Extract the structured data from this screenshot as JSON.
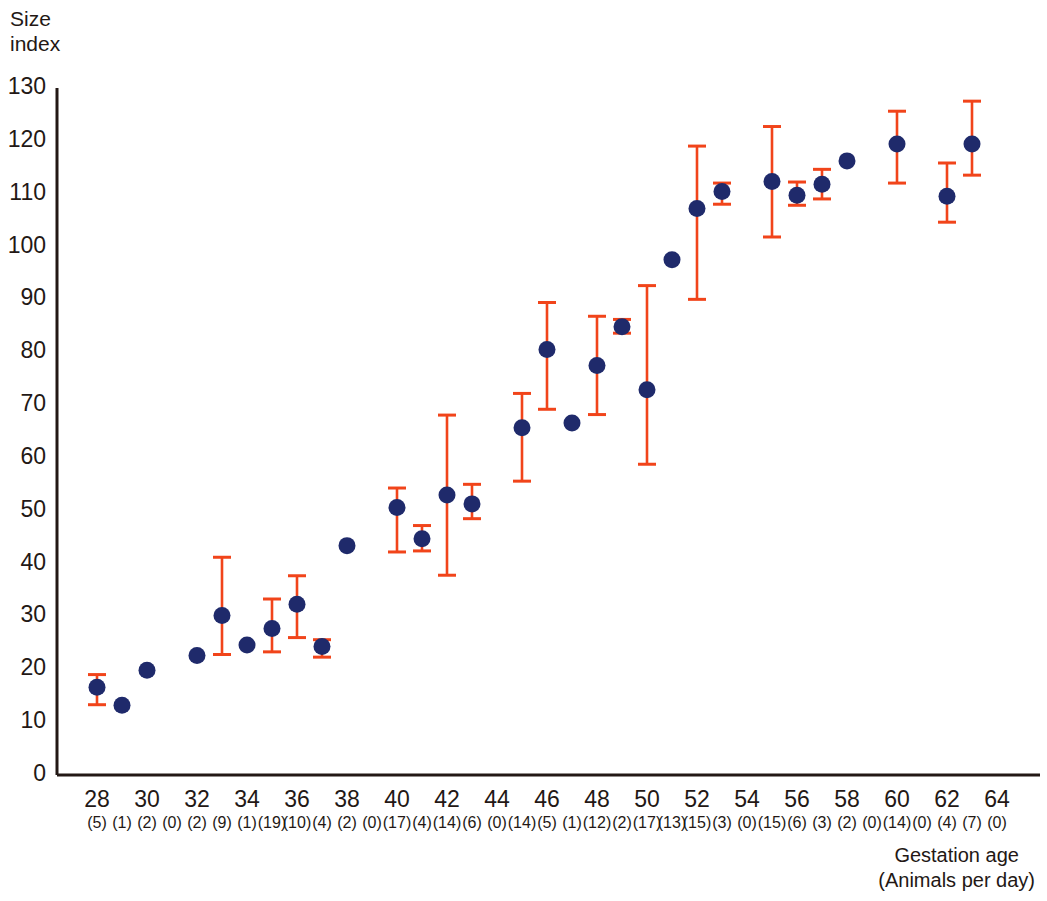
{
  "chart_data": {
    "type": "scatter",
    "title": "",
    "ylabel": "Size index",
    "xlabel": "Gestation age",
    "xlabel_sub": "(Animals per day)",
    "ylim": [
      0,
      130
    ],
    "ytick_values": [
      0,
      10,
      20,
      30,
      40,
      50,
      60,
      70,
      80,
      90,
      100,
      110,
      120,
      130
    ],
    "ytick_labels": [
      "0",
      "10",
      "20",
      "30",
      "40",
      "50",
      "60",
      "70",
      "80",
      "90",
      "100",
      "110",
      "120",
      "130"
    ],
    "xlim": [
      27,
      65
    ],
    "xtick_values": [
      28,
      30,
      32,
      34,
      36,
      38,
      40,
      42,
      44,
      46,
      48,
      50,
      52,
      54,
      56,
      58,
      60,
      62,
      64
    ],
    "xtick_labels": [
      "28",
      "30",
      "32",
      "34",
      "36",
      "38",
      "40",
      "42",
      "44",
      "46",
      "48",
      "50",
      "52",
      "54",
      "56",
      "58",
      "60",
      "62",
      "64"
    ],
    "grid": false,
    "legend": "none",
    "marker_color": "#1f2a6b",
    "errorbar_color": "#f1441a",
    "axis_color": "#231815",
    "counts_label_prefix": "(",
    "counts_label_suffix": ")",
    "points": [
      {
        "x": 28,
        "y": 16.6,
        "lo": 13.3,
        "hi": 19.0,
        "n": 5
      },
      {
        "x": 29,
        "y": 13.2,
        "lo": null,
        "hi": null,
        "n": 1
      },
      {
        "x": 30,
        "y": 19.8,
        "lo": null,
        "hi": null,
        "n": 2
      },
      {
        "x": 31,
        "y": null,
        "lo": null,
        "hi": null,
        "n": 0
      },
      {
        "x": 32,
        "y": 22.6,
        "lo": null,
        "hi": null,
        "n": 2
      },
      {
        "x": 33,
        "y": 30.2,
        "lo": 22.8,
        "hi": 41.2,
        "n": 9
      },
      {
        "x": 34,
        "y": 24.6,
        "lo": null,
        "hi": null,
        "n": 1
      },
      {
        "x": 35,
        "y": 27.7,
        "lo": 23.3,
        "hi": 33.3,
        "n": 19
      },
      {
        "x": 36,
        "y": 32.3,
        "lo": 26.0,
        "hi": 37.7,
        "n": 10
      },
      {
        "x": 37,
        "y": 24.3,
        "lo": 22.3,
        "hi": 25.6,
        "n": 4
      },
      {
        "x": 38,
        "y": 43.4,
        "lo": null,
        "hi": null,
        "n": 2
      },
      {
        "x": 39,
        "y": null,
        "lo": null,
        "hi": null,
        "n": 0
      },
      {
        "x": 40,
        "y": 50.6,
        "lo": 42.2,
        "hi": 54.3,
        "n": 17
      },
      {
        "x": 41,
        "y": 44.7,
        "lo": 42.4,
        "hi": 47.2,
        "n": 4
      },
      {
        "x": 42,
        "y": 53.0,
        "lo": 37.8,
        "hi": 68.1,
        "n": 14
      },
      {
        "x": 43,
        "y": 51.3,
        "lo": 48.5,
        "hi": 55.0,
        "n": 6
      },
      {
        "x": 44,
        "y": null,
        "lo": null,
        "hi": null,
        "n": 0
      },
      {
        "x": 45,
        "y": 65.7,
        "lo": 55.6,
        "hi": 72.2,
        "n": 14
      },
      {
        "x": 46,
        "y": 80.5,
        "lo": 69.2,
        "hi": 89.4,
        "n": 5
      },
      {
        "x": 47,
        "y": 66.6,
        "lo": null,
        "hi": null,
        "n": 1
      },
      {
        "x": 48,
        "y": 77.5,
        "lo": 68.2,
        "hi": 86.8,
        "n": 12
      },
      {
        "x": 49,
        "y": 84.8,
        "lo": 83.6,
        "hi": 86.2,
        "n": 2
      },
      {
        "x": 50,
        "y": 72.9,
        "lo": 58.8,
        "hi": 92.6,
        "n": 17
      },
      {
        "x": 51,
        "y": 97.5,
        "lo": null,
        "hi": null,
        "n": 13
      },
      {
        "x": 52,
        "y": 107.2,
        "lo": 90.0,
        "hi": 119.0,
        "n": 15
      },
      {
        "x": 53,
        "y": 110.4,
        "lo": 108.0,
        "hi": 112.0,
        "n": 3
      },
      {
        "x": 54,
        "y": null,
        "lo": null,
        "hi": null,
        "n": 0
      },
      {
        "x": 55,
        "y": 112.3,
        "lo": 101.8,
        "hi": 122.7,
        "n": 15
      },
      {
        "x": 56,
        "y": 109.7,
        "lo": 107.8,
        "hi": 112.2,
        "n": 6
      },
      {
        "x": 57,
        "y": 111.8,
        "lo": 109.0,
        "hi": 114.6,
        "n": 3
      },
      {
        "x": 58,
        "y": 116.2,
        "lo": null,
        "hi": null,
        "n": 2
      },
      {
        "x": 59,
        "y": null,
        "lo": null,
        "hi": null,
        "n": 0
      },
      {
        "x": 60,
        "y": 119.4,
        "lo": 112.0,
        "hi": 125.6,
        "n": 14
      },
      {
        "x": 61,
        "y": null,
        "lo": null,
        "hi": null,
        "n": 0
      },
      {
        "x": 62,
        "y": 109.5,
        "lo": 104.6,
        "hi": 115.8,
        "n": 4
      },
      {
        "x": 63,
        "y": 119.4,
        "lo": 113.5,
        "hi": 127.5,
        "n": 7
      },
      {
        "x": 64,
        "y": null,
        "lo": null,
        "hi": null,
        "n": 0
      }
    ]
  }
}
